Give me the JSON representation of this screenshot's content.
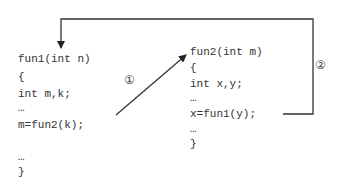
{
  "left_block": {
    "lines": [
      "fun1(int n)",
      "{",
      "int m,k;",
      "…",
      "m=fun2(k);",
      "…",
      "}"
    ]
  },
  "right_block": {
    "lines": [
      "fun2(int m)",
      "{",
      "int x,y;",
      "…",
      "x=fun1(y);",
      "…",
      "}"
    ]
  },
  "labels": {
    "call1": "①",
    "call2": "②"
  },
  "colors": {
    "line": "#333333",
    "text": "#333333"
  }
}
